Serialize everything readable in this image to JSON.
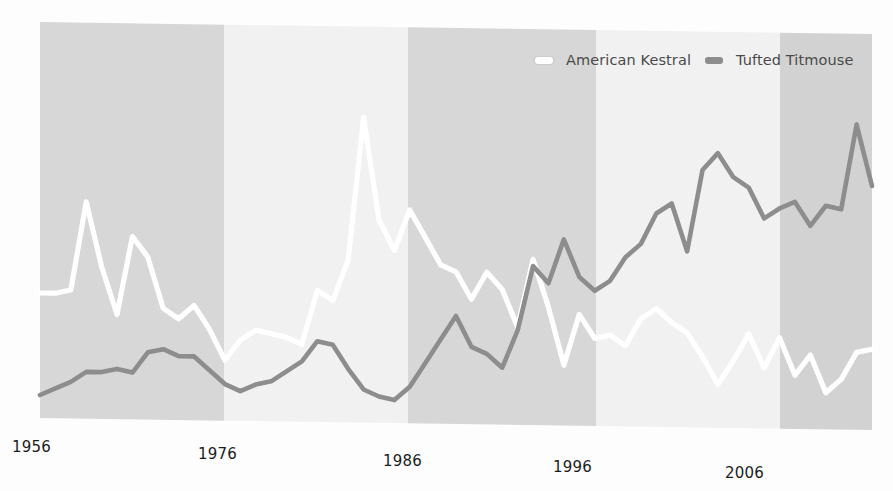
{
  "figure": {
    "background_color": "#fdfdfd",
    "plot_left": 40,
    "plot_right": 872,
    "plot_top": 22,
    "plot_bottom": 425
  },
  "legend": {
    "position": "top-right",
    "entries": [
      {
        "label": "American Kestral",
        "color": "#ffffff",
        "swatch_name": "legend-swatch-american-kestral"
      },
      {
        "label": "Tufted Titmouse",
        "color": "#8d8d8d",
        "swatch_name": "legend-swatch-tufted-titmouse"
      }
    ]
  },
  "x_ticks": [
    {
      "label": "1956",
      "x": 12,
      "y": 438
    },
    {
      "label": "1976",
      "x": 198,
      "y": 445
    },
    {
      "label": "1986",
      "x": 383,
      "y": 452
    },
    {
      "label": "1996",
      "x": 553,
      "y": 458
    },
    {
      "label": "2006",
      "x": 725,
      "y": 464
    }
  ],
  "bands": [
    {
      "x": 40,
      "width": 184,
      "color": "#d7d7d7"
    },
    {
      "x": 224,
      "width": 184,
      "color": "#f1f1f1"
    },
    {
      "x": 408,
      "width": 188,
      "color": "#d7d7d7"
    },
    {
      "x": 596,
      "width": 184,
      "color": "#f1f1f1"
    },
    {
      "x": 780,
      "width": 92,
      "color": "#d2d2d2"
    }
  ],
  "chart_data": {
    "type": "line",
    "title": "",
    "subtitle": "",
    "xlabel": "",
    "ylabel": "",
    "grid": false,
    "legend_position": "top-right",
    "xlim": [
      1956,
      2010
    ],
    "ylim": [
      0,
      100
    ],
    "x_tick_labels": [
      "1956",
      "1976",
      "1986",
      "1996",
      "2006"
    ],
    "x_tick_values": [
      1956,
      1976,
      1986,
      1996,
      2006
    ],
    "x": [
      1956,
      1957,
      1958,
      1959,
      1960,
      1961,
      1962,
      1963,
      1964,
      1965,
      1966,
      1967,
      1968,
      1969,
      1970,
      1971,
      1972,
      1973,
      1974,
      1975,
      1976,
      1977,
      1978,
      1979,
      1980,
      1981,
      1982,
      1983,
      1984,
      1985,
      1986,
      1987,
      1988,
      1989,
      1990,
      1991,
      1992,
      1993,
      1994,
      1995,
      1996,
      1997,
      1998,
      1999,
      2000,
      2001,
      2002,
      2003,
      2004,
      2005,
      2006,
      2007,
      2008,
      2009,
      2010
    ],
    "series": [
      {
        "name": "American Kestral",
        "color": "#ffffff",
        "values": [
          35,
          35,
          36,
          62,
          43,
          29,
          52,
          46,
          31,
          28,
          32,
          25,
          16,
          22,
          25,
          24,
          23,
          21,
          37,
          34,
          46,
          88,
          58,
          49,
          61,
          53,
          45,
          43,
          35,
          43,
          38,
          27,
          47,
          33,
          16,
          31,
          24,
          25,
          22,
          30,
          33,
          29,
          26,
          19,
          11,
          18,
          26,
          16,
          25,
          14,
          20,
          9,
          13,
          21,
          22
        ]
      },
      {
        "name": "Tufted Titmouse",
        "color": "#8d8d8d",
        "values": [
          5,
          7,
          9,
          12,
          12,
          13,
          12,
          18,
          19,
          17,
          17,
          13,
          9,
          7,
          9,
          10,
          13,
          16,
          22,
          21,
          14,
          8,
          6,
          5,
          9,
          16,
          23,
          30,
          21,
          19,
          15,
          26,
          45,
          40,
          53,
          42,
          38,
          41,
          48,
          52,
          61,
          64,
          50,
          74,
          79,
          72,
          69,
          60,
          63,
          65,
          58,
          64,
          63,
          88,
          70
        ]
      }
    ]
  }
}
